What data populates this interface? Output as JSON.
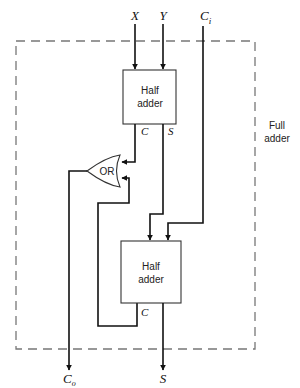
{
  "diagram": {
    "title": "Full adder",
    "enclosure_label_line1": "Full",
    "enclosure_label_line2": "adder",
    "inputs": {
      "x": "X",
      "y": "Y",
      "ci_main": "C",
      "ci_sub": "i"
    },
    "outputs": {
      "co_main": "C",
      "co_sub": "o",
      "s": "S"
    },
    "half_adder_1": {
      "line1": "Half",
      "line2": "adder",
      "out_c": "C",
      "out_s": "S"
    },
    "half_adder_2": {
      "line1": "Half",
      "line2": "adder",
      "out_c": "C"
    },
    "or_gate": {
      "label": "OR"
    }
  }
}
